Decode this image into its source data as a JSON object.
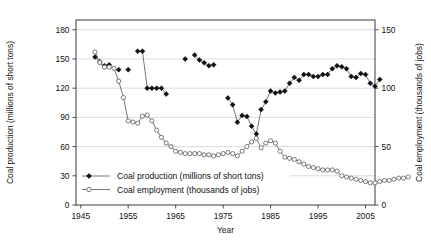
{
  "chart_data": {
    "type": "line",
    "title": "",
    "xlabel": "Year",
    "ylabel": "Coal production (millions of short tons)",
    "y2label": "Coal employment (thousands of jobs)",
    "xlim": [
      1944,
      2007
    ],
    "ylim": [
      0,
      190
    ],
    "y2lim": [
      0,
      158.33
    ],
    "xticks": [
      1945,
      1955,
      1965,
      1975,
      1985,
      1995,
      2005
    ],
    "yticks": [
      0,
      30,
      60,
      90,
      120,
      150,
      180
    ],
    "y2ticks": [
      0,
      50,
      100,
      150
    ],
    "grid": "horizontal",
    "legend_position": "lower-left-inside",
    "series": [
      {
        "name": "Coal production (millions of short tons)",
        "axis": "left",
        "marker": "filled-diamond",
        "unit": "millions of short tons",
        "points": [
          [
            1948,
            152
          ],
          [
            1949,
            147
          ],
          [
            1950,
            143
          ],
          [
            1951,
            144
          ],
          [
            1953,
            139
          ],
          [
            1955,
            139
          ],
          [
            1957,
            158
          ],
          [
            1958,
            158
          ],
          [
            1959,
            120
          ],
          [
            1960,
            120
          ],
          [
            1961,
            120
          ],
          [
            1962,
            120
          ],
          [
            1963,
            114
          ],
          [
            1967,
            150
          ],
          [
            1969,
            154
          ],
          [
            1970,
            149
          ],
          [
            1971,
            146
          ],
          [
            1972,
            143
          ],
          [
            1973,
            144
          ],
          [
            1976,
            110
          ],
          [
            1977,
            103
          ],
          [
            1978,
            85
          ],
          [
            1979,
            92
          ],
          [
            1980,
            91
          ],
          [
            1981,
            81
          ],
          [
            1982,
            73
          ],
          [
            1983,
            98
          ],
          [
            1984,
            106
          ],
          [
            1985,
            117
          ],
          [
            1986,
            115
          ],
          [
            1987,
            116
          ],
          [
            1988,
            117
          ],
          [
            1989,
            125
          ],
          [
            1990,
            131
          ],
          [
            1991,
            128
          ],
          [
            1992,
            134
          ],
          [
            1993,
            134
          ],
          [
            1994,
            132
          ],
          [
            1995,
            132
          ],
          [
            1996,
            134
          ],
          [
            1997,
            134
          ],
          [
            1998,
            140
          ],
          [
            1999,
            143
          ],
          [
            2000,
            142
          ],
          [
            2001,
            140
          ],
          [
            2002,
            132
          ],
          [
            2003,
            131
          ],
          [
            2004,
            135
          ],
          [
            2005,
            134
          ],
          [
            2006,
            125
          ],
          [
            2007,
            122
          ],
          [
            2008,
            129
          ]
        ]
      },
      {
        "name": "Coal employment (thousands of jobs)",
        "axis": "right",
        "marker": "open-circle",
        "unit": "thousands of jobs",
        "points": [
          [
            1948,
            131
          ],
          [
            1949,
            122
          ],
          [
            1950,
            118
          ],
          [
            1951,
            118
          ],
          [
            1952,
            117
          ],
          [
            1953,
            106
          ],
          [
            1954,
            92
          ],
          [
            1955,
            72
          ],
          [
            1956,
            71
          ],
          [
            1957,
            70
          ],
          [
            1958,
            76
          ],
          [
            1959,
            77
          ],
          [
            1960,
            72
          ],
          [
            1961,
            64
          ],
          [
            1962,
            58
          ],
          [
            1963,
            53
          ],
          [
            1964,
            50
          ],
          [
            1965,
            46
          ],
          [
            1966,
            45
          ],
          [
            1967,
            44
          ],
          [
            1968,
            44
          ],
          [
            1969,
            44
          ],
          [
            1970,
            44
          ],
          [
            1971,
            43
          ],
          [
            1972,
            43
          ],
          [
            1973,
            42
          ],
          [
            1974,
            43
          ],
          [
            1975,
            44
          ],
          [
            1976,
            45
          ],
          [
            1977,
            44
          ],
          [
            1978,
            42
          ],
          [
            1979,
            46
          ],
          [
            1980,
            50
          ],
          [
            1981,
            54
          ],
          [
            1982,
            57
          ],
          [
            1983,
            49
          ],
          [
            1984,
            53
          ],
          [
            1985,
            55
          ],
          [
            1986,
            53
          ],
          [
            1987,
            46
          ],
          [
            1988,
            41
          ],
          [
            1989,
            40
          ],
          [
            1990,
            39
          ],
          [
            1991,
            37
          ],
          [
            1992,
            35
          ],
          [
            1993,
            33
          ],
          [
            1994,
            32
          ],
          [
            1995,
            31
          ],
          [
            1996,
            30
          ],
          [
            1997,
            30
          ],
          [
            1998,
            30
          ],
          [
            1999,
            29
          ],
          [
            2000,
            25
          ],
          [
            2001,
            24
          ],
          [
            2002,
            23
          ],
          [
            2003,
            22
          ],
          [
            2004,
            21
          ],
          [
            2005,
            20
          ],
          [
            2006,
            19
          ],
          [
            2007,
            19
          ],
          [
            2008,
            20
          ],
          [
            2009,
            21
          ],
          [
            2010,
            21
          ],
          [
            2011,
            22
          ],
          [
            2012,
            23
          ],
          [
            2013,
            23
          ],
          [
            2014,
            24
          ]
        ]
      }
    ]
  },
  "legend": {
    "items": [
      {
        "label": "Coal production (millions of short tons)",
        "marker": "filled-diamond"
      },
      {
        "label": "Coal employment (thousands of jobs)",
        "marker": "open-circle"
      }
    ]
  }
}
